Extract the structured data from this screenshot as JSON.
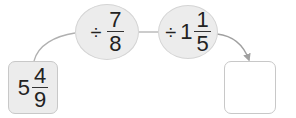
{
  "diagram": {
    "type": "division-chain",
    "start": {
      "whole": "5",
      "numerator": "4",
      "denominator": "9"
    },
    "steps": [
      {
        "operator": "÷",
        "whole": "",
        "numerator": "7",
        "denominator": "8"
      },
      {
        "operator": "÷",
        "whole": "1",
        "numerator": "1",
        "denominator": "5"
      }
    ],
    "result": {
      "value": ""
    },
    "colors": {
      "fill": "#ececec",
      "border": "#c8c8c8",
      "line": "#a8a8a8",
      "text": "#222222"
    }
  }
}
